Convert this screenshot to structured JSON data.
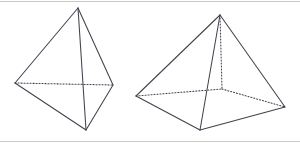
{
  "figure": {
    "title": "Two geometric solids line drawing",
    "canvas": {
      "width": 300,
      "height": 143,
      "background": "#ffffff"
    },
    "style": {
      "edge_color": "#42424e",
      "hidden_edge_color": "#42424e",
      "frame_color": "#c9c9c9",
      "edge_width": 1.05,
      "hidden_dash_pattern": "1.1 1.9"
    },
    "frame": {
      "name": "thin-top-and-bottom-rules",
      "top_line": {
        "x1": 0,
        "y1": 1,
        "x2": 300,
        "y2": 1
      },
      "bottom_line": {
        "x1": 0,
        "y1": 141,
        "x2": 300,
        "y2": 141
      }
    },
    "shapes": [
      {
        "id": "tetrahedron",
        "label": "Triangular pyramid",
        "vertices": {
          "apex": {
            "x": 78,
            "y": 8
          },
          "left": {
            "x": 15,
            "y": 83
          },
          "right": {
            "x": 113,
            "y": 85
          },
          "front": {
            "x": 86,
            "y": 130
          }
        },
        "visible_edges": [
          {
            "from": "apex",
            "to": "left"
          },
          {
            "from": "apex",
            "to": "right"
          },
          {
            "from": "apex",
            "to": "front"
          },
          {
            "from": "left",
            "to": "front"
          },
          {
            "from": "right",
            "to": "front"
          }
        ],
        "hidden_edges": [
          {
            "from": "left",
            "to": "right"
          }
        ]
      },
      {
        "id": "square-pyramid",
        "label": "Square pyramid",
        "vertices": {
          "apex": {
            "x": 220,
            "y": 15
          },
          "base_left": {
            "x": 136,
            "y": 96
          },
          "base_front": {
            "x": 200,
            "y": 130
          },
          "base_right": {
            "x": 285,
            "y": 107
          },
          "base_back": {
            "x": 222,
            "y": 89
          }
        },
        "visible_edges": [
          {
            "from": "apex",
            "to": "base_left"
          },
          {
            "from": "apex",
            "to": "base_front"
          },
          {
            "from": "apex",
            "to": "base_right"
          },
          {
            "from": "base_left",
            "to": "base_front"
          },
          {
            "from": "base_front",
            "to": "base_right"
          }
        ],
        "hidden_edges": [
          {
            "from": "base_left",
            "to": "base_back"
          },
          {
            "from": "base_back",
            "to": "base_right"
          },
          {
            "from": "apex",
            "to": "base_back"
          }
        ]
      }
    ]
  }
}
